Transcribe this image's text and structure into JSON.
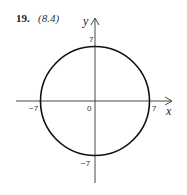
{
  "problem": {
    "number": "19.",
    "reference": "(8.4)"
  },
  "graph": {
    "x_axis_label": "x",
    "y_axis_label": "y",
    "origin_label": "0",
    "ticks": {
      "x_neg": "−7",
      "x_pos": "7",
      "y_pos": "7",
      "y_neg": "−7"
    },
    "curve": {
      "type": "circle",
      "center": [
        0,
        0
      ],
      "radius": 7,
      "equation": "x^2 + y^2 = 49"
    },
    "colors": {
      "curve": "#111111",
      "axes": "#333333"
    }
  }
}
